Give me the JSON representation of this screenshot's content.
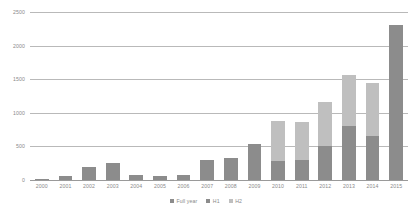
{
  "chart_data": {
    "type": "bar",
    "title": "",
    "subtitle": "",
    "xlabel": "",
    "ylabel": "",
    "ylim": [
      0,
      2500
    ],
    "yticks": [
      2500,
      2000,
      1500,
      1000,
      500,
      0
    ],
    "ytick_labels": [
      "2500",
      "2000",
      "1500",
      "1000",
      "500",
      "0"
    ],
    "grid": true,
    "stacked": true,
    "legend_position": "bottom",
    "categories": [
      "2000",
      "2001",
      "2002",
      "2003",
      "2004",
      "2005",
      "2006",
      "2007",
      "2008",
      "2009",
      "2010",
      "2011",
      "2012",
      "2013",
      "2014",
      "2015"
    ],
    "series": [
      {
        "name": "Full year",
        "color": "#8c8c8c",
        "values": [
          15,
          60,
          190,
          250,
          75,
          60,
          70,
          300,
          330,
          540,
          null,
          null,
          null,
          null,
          null,
          null
        ]
      },
      {
        "name": "H1",
        "color": "#8c8c8c",
        "values": [
          null,
          null,
          null,
          null,
          null,
          null,
          null,
          null,
          null,
          null,
          290,
          300,
          500,
          800,
          650,
          2310
        ]
      },
      {
        "name": "H2",
        "color": "#bfbfbf",
        "values": [
          null,
          null,
          null,
          null,
          null,
          null,
          null,
          null,
          null,
          null,
          590,
          570,
          660,
          760,
          800,
          null
        ]
      }
    ],
    "totals": [
      15,
      60,
      190,
      250,
      75,
      60,
      70,
      300,
      330,
      540,
      880,
      870,
      1160,
      1560,
      1450,
      2310
    ]
  },
  "legend": {
    "items": [
      {
        "label": "Full year",
        "color": "#8c8c8c"
      },
      {
        "label": "H1",
        "color": "#8c8c8c"
      },
      {
        "label": "H2",
        "color": "#bfbfbf"
      }
    ]
  },
  "colors": {
    "dark": "#8c8c8c",
    "light": "#bfbfbf",
    "gridline": "#b9b9b9",
    "axis_text": "#8a8a8a",
    "background": "#ffffff"
  }
}
